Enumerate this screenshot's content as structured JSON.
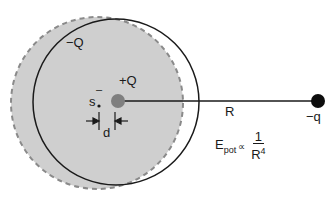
{
  "diagram": {
    "colors": {
      "cloud_fill": "#cfcfcf",
      "cloud_outline": "#8a8a8a",
      "orbit_outline": "#1a1a1a",
      "nucleus": "#7f7f7f",
      "point_charge": "#0d0d0d"
    },
    "labels": {
      "cloud_charge": "−Q",
      "nucleus_charge": "+Q",
      "s_label": "s",
      "s_bar": "–",
      "displacement": "d",
      "distance": "R",
      "point_charge": "−q"
    },
    "formula": {
      "lhs": "E",
      "lhs_sub": "pot",
      "relation": "∝",
      "numerator": "1",
      "denominator_base": "R",
      "denominator_exp": "4"
    }
  }
}
